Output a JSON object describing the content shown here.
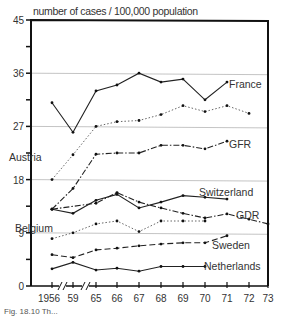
{
  "chart_data": {
    "type": "line",
    "title": "",
    "ylabel": "number of cases / 100,000 population",
    "xlabel": "",
    "ylim": [
      0,
      45
    ],
    "yticks": [
      0,
      9,
      18,
      27,
      36,
      45
    ],
    "grid": "horizontal lines at 9, 18, 27, 36",
    "categories": [
      "1956",
      "59",
      "65",
      "66",
      "67",
      "68",
      "69",
      "70",
      "71",
      "72",
      "73"
    ],
    "axis_breaks": [
      "between 1956 and 59",
      "between 59 and 65"
    ],
    "series": [
      {
        "name": "France",
        "style": "solid",
        "values": [
          31,
          26,
          33,
          34,
          36,
          34.5,
          35,
          31.5,
          34.5,
          null,
          null
        ]
      },
      {
        "name": "Austria",
        "style": "dotted",
        "values": [
          18,
          22.2,
          27,
          27.8,
          28,
          29,
          30.5,
          29.5,
          30.5,
          29.2,
          null
        ]
      },
      {
        "name": "GFR",
        "style": "dash-dot",
        "values": [
          13,
          16.5,
          22.3,
          22.5,
          22.5,
          23.8,
          23.8,
          23.2,
          24.5,
          null,
          null
        ]
      },
      {
        "name": "Switzerland",
        "style": "solid",
        "values": [
          13,
          12.3,
          14.5,
          15.5,
          13.2,
          14.2,
          15.3,
          15,
          14.7,
          null,
          null
        ]
      },
      {
        "name": "GDR",
        "style": "dash-dot",
        "values": [
          13,
          null,
          14,
          15.8,
          14.2,
          13.2,
          12.3,
          11.5,
          12.2,
          11.3,
          10.5
        ]
      },
      {
        "name": "Belgium",
        "style": "dotted",
        "values": [
          8,
          9,
          10.5,
          11,
          9.2,
          11,
          11,
          11,
          null,
          null,
          null
        ]
      },
      {
        "name": "Sweden",
        "style": "dashed",
        "values": [
          5.3,
          4.8,
          6.1,
          6.4,
          6.8,
          7.1,
          7.3,
          7.3,
          8.5,
          null,
          null
        ]
      },
      {
        "name": "Netherlands",
        "style": "solid",
        "values": [
          2.9,
          4,
          2.7,
          3,
          2.5,
          3.3,
          3.3,
          3.3,
          null,
          null,
          null
        ]
      }
    ],
    "annotations": [
      "France",
      "Austria",
      "GFR",
      "Switzerland",
      "GDR",
      "Belgium",
      "Sweden",
      "Netherlands"
    ]
  },
  "caption": "Fig. 18.10  Th..."
}
